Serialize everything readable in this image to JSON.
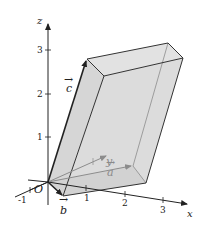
{
  "diagram": {
    "type": "3d-parallelepiped",
    "colors": {
      "face_fill": "#d9d9d9",
      "edge": "#333333",
      "hidden_edge": "#8c8c8c",
      "axis": "#222222",
      "background": "#ffffff"
    },
    "axes": {
      "x": {
        "label": "x",
        "ticks": [
          "-1",
          "1",
          "2",
          "3"
        ]
      },
      "y": {
        "label": "y"
      },
      "z": {
        "label": "z",
        "ticks": [
          "1",
          "2",
          "3"
        ]
      }
    },
    "origin_label": "O",
    "vectors": [
      {
        "name": "a",
        "label": "a",
        "arrow_label": "→"
      },
      {
        "name": "b",
        "label": "b",
        "arrow_label": "→"
      },
      {
        "name": "c",
        "label": "c",
        "arrow_label": "→"
      }
    ]
  }
}
